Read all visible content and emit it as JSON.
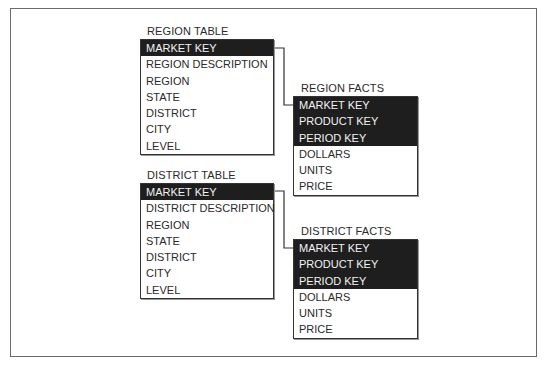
{
  "region_table": {
    "title": "REGION TABLE",
    "rows": [
      {
        "label": "MARKET KEY",
        "key": true
      },
      {
        "label": "REGION DESCRIPTION",
        "key": false
      },
      {
        "label": "REGION",
        "key": false
      },
      {
        "label": "STATE",
        "key": false
      },
      {
        "label": "DISTRICT",
        "key": false
      },
      {
        "label": "CITY",
        "key": false
      },
      {
        "label": "LEVEL",
        "key": false
      }
    ]
  },
  "region_facts": {
    "title": "REGION FACTS",
    "rows": [
      {
        "label": "MARKET KEY",
        "key": true
      },
      {
        "label": "PRODUCT KEY",
        "key": true
      },
      {
        "label": "PERIOD KEY",
        "key": true
      },
      {
        "label": "DOLLARS",
        "key": false
      },
      {
        "label": "UNITS",
        "key": false
      },
      {
        "label": "PRICE",
        "key": false
      }
    ]
  },
  "district_table": {
    "title": "DISTRICT TABLE",
    "rows": [
      {
        "label": "MARKET KEY",
        "key": true
      },
      {
        "label": "DISTRICT DESCRIPTION",
        "key": false
      },
      {
        "label": "REGION",
        "key": false
      },
      {
        "label": "STATE",
        "key": false
      },
      {
        "label": "DISTRICT",
        "key": false
      },
      {
        "label": "CITY",
        "key": false
      },
      {
        "label": "LEVEL",
        "key": false
      }
    ]
  },
  "district_facts": {
    "title": "DISTRICT FACTS",
    "rows": [
      {
        "label": "MARKET KEY",
        "key": true
      },
      {
        "label": "PRODUCT KEY",
        "key": true
      },
      {
        "label": "PERIOD KEY",
        "key": true
      },
      {
        "label": "DOLLARS",
        "key": false
      },
      {
        "label": "UNITS",
        "key": false
      },
      {
        "label": "PRICE",
        "key": false
      }
    ]
  },
  "colors": {
    "key_fill": "#1e1e1e",
    "key_text": "#f2f2f2",
    "border": "#333333",
    "frame": "#6a6a6a"
  }
}
